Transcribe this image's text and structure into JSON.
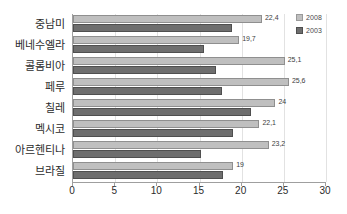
{
  "chart_data": {
    "type": "bar",
    "orientation": "horizontal",
    "title": "",
    "xlabel": "",
    "ylabel": "",
    "xlim": [
      0,
      30
    ],
    "xticks": [
      0,
      5,
      10,
      15,
      20,
      25,
      30
    ],
    "grid": true,
    "legend_position": "top-right",
    "categories": [
      "중남미",
      "베네수엘라",
      "콜롬비아",
      "페루",
      "칠레",
      "멕시코",
      "아르헨티나",
      "브라질"
    ],
    "series": [
      {
        "name": "2008",
        "color": "#bfbfbf",
        "values": [
          22.4,
          19.7,
          25.1,
          25.6,
          24,
          22.1,
          23.2,
          19
        ],
        "labels": [
          "22,4",
          "19,7",
          "25,1",
          "25,6",
          "24",
          "22,1",
          "23,2",
          "19"
        ]
      },
      {
        "name": "2003",
        "color": "#6e6e6e",
        "values": [
          18.8,
          15.5,
          17.0,
          17.7,
          21.1,
          19.0,
          15.2,
          17.8
        ],
        "labels": [
          "",
          "",
          "",
          "",
          "",
          "",
          "",
          ""
        ]
      }
    ]
  },
  "legend": {
    "items": [
      {
        "label": "2008",
        "color": "#bfbfbf"
      },
      {
        "label": "2003",
        "color": "#6e6e6e"
      }
    ]
  },
  "axis": {
    "x_tick_labels": [
      "0",
      "5",
      "10",
      "15",
      "20",
      "25",
      "30"
    ]
  }
}
